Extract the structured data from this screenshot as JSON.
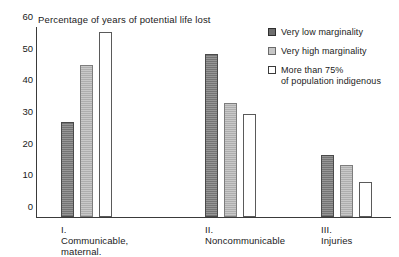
{
  "top_fragment": "",
  "chart_data": {
    "type": "bar",
    "title": "Percentage of years of potential life lost",
    "xlabel": "",
    "ylabel": "",
    "ylim": [
      0,
      60
    ],
    "yticks": [
      0,
      10,
      20,
      30,
      40,
      50,
      60
    ],
    "grid": false,
    "legend_position": "top-right",
    "categories": [
      "I. Communicable,\nmaternal.",
      "II. Noncommunicable",
      "III. Injuries"
    ],
    "series": [
      {
        "name": "Very low marginality",
        "values": [
          30,
          51.5,
          19.5
        ]
      },
      {
        "name": "Very high marginality",
        "values": [
          48,
          36,
          16.5
        ]
      },
      {
        "name": "More than 75%\nof population indigenous",
        "values": [
          58.5,
          32.5,
          11
        ]
      }
    ]
  },
  "colors": {
    "series_0": "#8a8a8a",
    "series_1": "#c2c2c2",
    "series_2": "#ffffff",
    "axis": "#3a3a3a",
    "text": "#1a1a1a"
  }
}
